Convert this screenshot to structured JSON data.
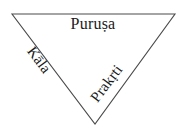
{
  "diagram": {
    "type": "inverted-triangle",
    "background_color": "#ffffff",
    "stroke_color": "#4a4a4a",
    "text_color": "#1a1a1a",
    "vertices": {
      "top_left": [
        12,
        14
      ],
      "top_right": [
        175,
        14
      ],
      "bottom_apex": [
        95,
        124
      ]
    },
    "labels": {
      "top": "Puruṣa",
      "left": "Kāla",
      "right": "Prakṛti"
    }
  }
}
